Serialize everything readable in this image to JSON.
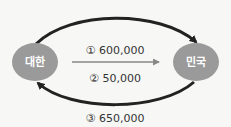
{
  "nodes": {
    "left": {
      "label": "대한",
      "color": "#9a9a9a"
    },
    "right": {
      "label": "민국",
      "color": "#9a9a9a"
    }
  },
  "flows": [
    {
      "label": "① 600,000",
      "direction": "top arc, left to right",
      "color": "#222222"
    },
    {
      "label": "② 50,000",
      "direction": "middle, left to right",
      "color": "#888888"
    },
    {
      "label": "③ 650,000",
      "direction": "bottom arc, right to left",
      "color": "#222222"
    }
  ]
}
